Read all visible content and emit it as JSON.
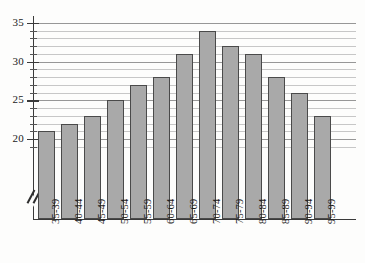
{
  "chart_data": {
    "type": "bar",
    "title": "",
    "subtitle": "",
    "xlabel": "",
    "ylabel": "",
    "categories": [
      "35-39",
      "40-44",
      "45-49",
      "50-54",
      "55-59",
      "60-64",
      "65-69",
      "70-74",
      "75-79",
      "80-84",
      "85-89",
      "90-94",
      "95-99"
    ],
    "values": [
      21,
      22,
      23,
      25,
      27,
      28,
      31,
      34,
      32,
      31,
      28,
      26,
      23
    ],
    "series": [
      {
        "name": "",
        "values": [
          21,
          22,
          23,
          25,
          27,
          28,
          31,
          34,
          32,
          31,
          28,
          26,
          23
        ]
      }
    ],
    "ylim": [
      18.5,
      35.6
    ],
    "y_major_ticks": [
      20,
      25,
      30,
      35
    ],
    "y_major_tick_labels": [
      "20",
      "25",
      "30",
      "35"
    ],
    "y_minor_tick_step": 1,
    "grid": true,
    "grid_axis": "y",
    "legend": false,
    "legend_position": "none",
    "axis_break": true,
    "axis_break_symbol": "//",
    "xtick_rotation": -90,
    "colors": {
      "bar_fill": "#a9a9a9",
      "bar_edge": "#4a4a4a",
      "gridline": "#9a9a9a",
      "gridline_major": "#7d7d7d",
      "axis": "#3a3a3a",
      "text": "#1a1a1a",
      "background": "#fdfdfc"
    }
  }
}
